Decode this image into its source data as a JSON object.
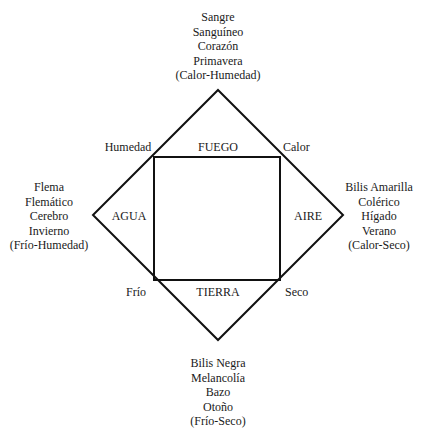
{
  "diagram": {
    "elements": {
      "top": "FUEGO",
      "left": "AGUA",
      "right": "AIRE",
      "bottom": "TIERRA"
    },
    "qualities": {
      "top_left": "Humedad",
      "top_right": "Calor",
      "bottom_left": "Frío",
      "bottom_right": "Seco"
    },
    "humors": {
      "top": [
        "Sangre",
        "Sanguíneo",
        "Corazón",
        "Primavera",
        "(Calor-Humedad)"
      ],
      "left": [
        "Flema",
        "Flemático",
        "Cerebro",
        "Invierno",
        "(Frío-Humedad)"
      ],
      "right": [
        "Bilis Amarilla",
        "Colérico",
        "Hígado",
        "Verano",
        "(Calor-Seco)"
      ],
      "bottom": [
        "Bilis Negra",
        "Melancolía",
        "Bazo",
        "Otoño",
        "(Frío-Seco)"
      ]
    }
  }
}
